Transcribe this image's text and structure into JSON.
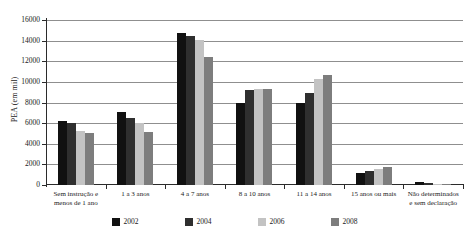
{
  "chart_data": {
    "type": "bar",
    "title": "",
    "xlabel": "",
    "ylabel": "PEA (em mil)",
    "ylim": [
      0,
      16000
    ],
    "ytick_step": 2000,
    "yticks": [
      "0",
      "2000",
      "4000",
      "6000",
      "8000",
      "10000",
      "12000",
      "14000",
      "16000"
    ],
    "grid": true,
    "legend_position": "bottom",
    "categories": [
      "Sem instrução e\nmenos de 1 ano",
      "1 a 3 anos",
      "4 a 7 anos",
      "8 a 10 anos",
      "11 a 14 anos",
      "15 anos ou mais",
      "Não determinados\ne sem declaração"
    ],
    "series": [
      {
        "name": "2002",
        "color": "#111111",
        "values": [
          6200,
          7100,
          14750,
          8000,
          7950,
          1200,
          250
        ]
      },
      {
        "name": "2004",
        "color": "#2f2f2f",
        "values": [
          6000,
          6450,
          14450,
          9200,
          8900,
          1350,
          150
        ]
      },
      {
        "name": "2006",
        "color": "#c3c3c3",
        "values": [
          5200,
          6050,
          14100,
          9300,
          10250,
          1550,
          100
        ]
      },
      {
        "name": "2008",
        "color": "#7d7d7d",
        "values": [
          5000,
          5150,
          12450,
          9300,
          10650,
          1750,
          100
        ]
      }
    ]
  },
  "axis": {
    "y_title": "PEA (em mil)"
  },
  "legend": {
    "items": [
      {
        "label": "2002",
        "color": "#111111"
      },
      {
        "label": "2004",
        "color": "#2f2f2f"
      },
      {
        "label": "2006",
        "color": "#c3c3c3"
      },
      {
        "label": "2008",
        "color": "#7d7d7d"
      }
    ]
  }
}
